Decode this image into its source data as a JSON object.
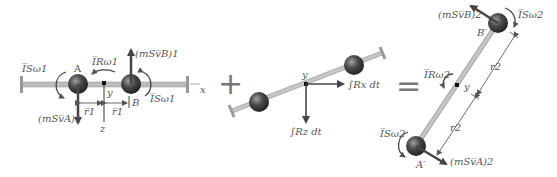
{
  "diagram": {
    "type": "impulse-momentum diagram",
    "operators": {
      "plus": "+",
      "equals": "="
    },
    "panel1": {
      "name": "initial momentum",
      "points": {
        "A": "A",
        "B": "B"
      },
      "labels": {
        "is_omega_left": "I̅Sω1",
        "ir_omega": "I̅Rω1",
        "is_omega_right": "I̅Sω1",
        "ms_vb": "(mSv̅B)1",
        "ms_va": "(mSv̅A)1",
        "r1_left": "r̅1",
        "r1_right": "r̅1",
        "y": "y",
        "z": "z",
        "x": "x"
      }
    },
    "panel2": {
      "name": "external impulses",
      "labels": {
        "y": "y",
        "rx_impulse": "∫Rx dt",
        "rz_impulse": "∫Rz dt"
      }
    },
    "panel3": {
      "name": "final momentum",
      "points": {
        "A": "A′",
        "B": "B′"
      },
      "labels": {
        "ms_vb": "(mSv̅B)2",
        "is_omega_top": "I̅Sω2",
        "ir_omega": "I̅Rω2",
        "y": "y",
        "r2_top": "r2",
        "r2_bottom": "r2",
        "is_omega_bottom": "I̅Sω2",
        "ms_va": "(mSv̅A)2"
      }
    },
    "colors": {
      "rod": "#b8b8b8",
      "rod_edge": "#8a8a8a",
      "sphere_dark": "#2e2e2e",
      "sphere_light": "#8a8a8a",
      "arrow": "#444444",
      "text": "#555555"
    }
  }
}
